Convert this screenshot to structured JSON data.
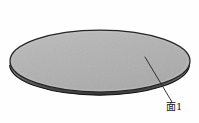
{
  "figure": {
    "name": "disc-perspective-drawing",
    "background_color": "#fefefe",
    "width": 199,
    "height": 123
  },
  "disc": {
    "name": "circular-disc",
    "top_face": {
      "fill_color": "#b2b2b2",
      "stroke_color": "#2a2a2a",
      "center_x": 100,
      "center_y": 61,
      "radius_x": 90,
      "radius_y": 31
    },
    "side_wall": {
      "fill_color": "#8a8a8a",
      "stroke_color": "#1e1e1e",
      "thickness": 5
    },
    "shading": {
      "highlight_color": "#c4c4c4",
      "shadow_color": "#9a9a9a"
    }
  },
  "annotation": {
    "leader_line": {
      "name": "leader-line-surface-1",
      "stroke_color": "#2b2b2b",
      "stroke_width": 0.9,
      "start_x": 145,
      "start_y": 57,
      "end_x": 172,
      "end_y": 102
    },
    "label": {
      "text": "面1",
      "character": "面",
      "number": "1",
      "meaning": "Surface 1",
      "color": "#1a1a1a",
      "x": 166,
      "y": 101
    }
  }
}
